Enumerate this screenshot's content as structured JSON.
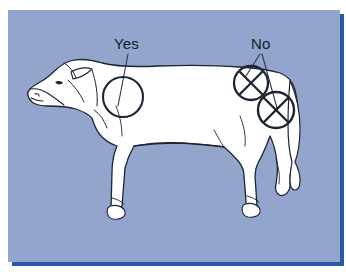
{
  "figure": {
    "type": "diagram",
    "title_text": "",
    "background_color": "#93a5cc",
    "shadow_color": "#2a5ba8",
    "animal_fill": "#ffffff",
    "outline_color": "#1d2433",
    "label_color": "#141c2e"
  },
  "labels": [
    {
      "id": "yes",
      "text": "Yes",
      "x": 106,
      "y": 26,
      "marker": "open-circle",
      "meaning": "approved injection site",
      "leader_lines": 1
    },
    {
      "id": "no",
      "text": "No",
      "x": 243,
      "y": 26,
      "marker": "crossed-circle",
      "meaning": "injection site to avoid",
      "leader_lines": 2
    }
  ],
  "markers": [
    {
      "id": "site-neck",
      "kind": "open-circle",
      "label": "Yes",
      "cx": 115,
      "cy": 87,
      "r": 20,
      "crossed": false,
      "body_region": "neck"
    },
    {
      "id": "site-rump",
      "kind": "crossed-circle",
      "label": "No",
      "cx": 243,
      "cy": 73,
      "r": 17,
      "crossed": true,
      "body_region": "rump"
    },
    {
      "id": "site-hindquarter",
      "kind": "crossed-circle",
      "label": "No",
      "cx": 268,
      "cy": 100,
      "r": 18,
      "crossed": true,
      "body_region": "hindquarter"
    }
  ]
}
